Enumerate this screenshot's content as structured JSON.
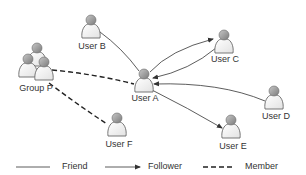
{
  "diagram": {
    "type": "social-network",
    "colors": {
      "edge": "#333333",
      "text": "#333333",
      "icon_body": "#f2f2f2",
      "icon_outline": "#666666",
      "icon_head": "#9a9a9a"
    },
    "nodes": [
      {
        "id": "B",
        "label": "User B",
        "kind": "user",
        "x": 91,
        "y": 28,
        "label_x": 92,
        "label_y": 41
      },
      {
        "id": "C",
        "label": "User C",
        "kind": "user",
        "x": 224,
        "y": 43,
        "label_x": 225,
        "label_y": 54
      },
      {
        "id": "A",
        "label": "User A",
        "kind": "user",
        "x": 144,
        "y": 82,
        "label_x": 145,
        "label_y": 93
      },
      {
        "id": "D",
        "label": "User D",
        "kind": "user",
        "x": 274,
        "y": 99,
        "label_x": 276,
        "label_y": 111
      },
      {
        "id": "E",
        "label": "User E",
        "kind": "user",
        "x": 231,
        "y": 128,
        "label_x": 233,
        "label_y": 141
      },
      {
        "id": "F",
        "label": "User F",
        "kind": "user",
        "x": 117,
        "y": 126,
        "label_x": 119,
        "label_y": 139
      },
      {
        "id": "P",
        "label": "Group P",
        "kind": "group",
        "x": 34,
        "y": 62,
        "label_x": 36,
        "label_y": 83
      }
    ],
    "edges": [
      {
        "from": "B",
        "to": "A",
        "type": "friend"
      },
      {
        "from": "A",
        "to": "C",
        "type": "follower"
      },
      {
        "from": "C",
        "to": "A",
        "type": "follower"
      },
      {
        "from": "D",
        "to": "A",
        "type": "follower"
      },
      {
        "from": "A",
        "to": "E",
        "type": "follower"
      },
      {
        "from": "P",
        "to": "A",
        "type": "member"
      },
      {
        "from": "P",
        "to": "F",
        "type": "member"
      }
    ]
  },
  "legend": {
    "items": [
      {
        "key": "friend",
        "label": "Friend",
        "style": "solid"
      },
      {
        "key": "follower",
        "label": "Follower",
        "style": "solid-arrow"
      },
      {
        "key": "member",
        "label": "Member",
        "style": "dashed"
      }
    ]
  }
}
